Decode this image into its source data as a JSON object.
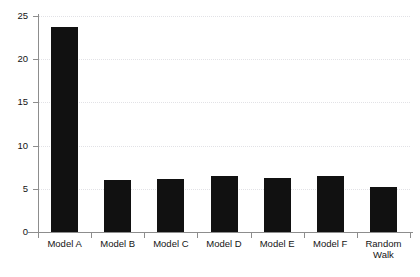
{
  "chart_data": {
    "type": "bar",
    "title": "",
    "subtitle": "",
    "xlabel": "",
    "ylabel": "",
    "categories": [
      "Model A",
      "Model B",
      "Model C",
      "Model D",
      "Model E",
      "Model F",
      "Random\nWalk"
    ],
    "values": [
      23.7,
      6.0,
      6.1,
      6.5,
      6.2,
      6.5,
      5.2
    ],
    "ylim": [
      0,
      25
    ],
    "yticks": [
      0,
      5,
      10,
      15,
      20,
      25
    ],
    "ytick_labels": [
      "0",
      "5",
      "10",
      "15",
      "20",
      "25"
    ],
    "grid": true,
    "legend": false,
    "legend_position": "none",
    "bar_color": "#111111",
    "gridline_color": "#e2e2e6",
    "axis_color": "#8d8d8d",
    "text_color": "#141414"
  }
}
